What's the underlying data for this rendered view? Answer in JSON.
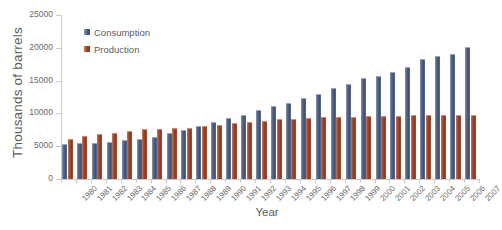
{
  "chart_data": {
    "type": "bar",
    "title": "",
    "xlabel": "Year",
    "ylabel": "Thousands of  barrels",
    "ylim": [
      0,
      25000
    ],
    "ytick_values": [
      0,
      5000,
      10000,
      15000,
      20000,
      25000
    ],
    "ytick_labels": [
      "0",
      "5000",
      "10000",
      "15000",
      "20000",
      "25000"
    ],
    "grid": false,
    "legend_position": "upper-left-inside",
    "categories": [
      "1980",
      "1981",
      "1982",
      "1983",
      "1984",
      "1985",
      "1986",
      "1987",
      "1988",
      "1989",
      "1990",
      "1991",
      "1992",
      "1993",
      "1994",
      "1995",
      "1996",
      "1997",
      "1998",
      "1999",
      "2000",
      "2001",
      "2002",
      "2003",
      "2004",
      "2005",
      "2006",
      "2007"
    ],
    "series": [
      {
        "name": "Consumption",
        "color": "#47597e",
        "values": [
          5400,
          5500,
          5500,
          5650,
          5950,
          6150,
          6450,
          6950,
          7500,
          8050,
          8700,
          9250,
          9800,
          10450,
          11150,
          11600,
          12350,
          13000,
          13950,
          14450,
          15350,
          15650,
          16250,
          17000,
          18250,
          18700,
          19100,
          20050
        ]
      },
      {
        "name": "Production",
        "color": "#9c3d22",
        "values": [
          6150,
          6500,
          6800,
          7000,
          7350,
          7550,
          7700,
          7800,
          7800,
          8050,
          8300,
          8500,
          8700,
          8850,
          9100,
          9150,
          9300,
          9400,
          9450,
          9450,
          9600,
          9650,
          9600,
          9700,
          9750,
          9800,
          9750,
          9700
        ]
      }
    ]
  },
  "legend": {
    "items": [
      {
        "label": "Consumption",
        "swatch": "consumption"
      },
      {
        "label": "Production",
        "swatch": "production"
      }
    ]
  }
}
